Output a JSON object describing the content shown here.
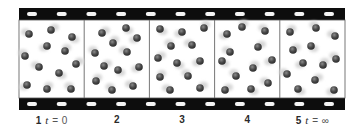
{
  "figure": {
    "colors": {
      "film": "#0d0d0d",
      "sprocket": "#f4f4f4",
      "frame_bg": "#ffffff",
      "frame_divider": "#666666",
      "molecule": "#4a4a4a",
      "molecule_highlight": "#8a8a8a",
      "motion_blur": "#d6d6d6"
    },
    "frames": [
      {
        "number": "1",
        "time_var": "t",
        "equals": "=",
        "time_value": "0",
        "molecules": [
          [
            29,
            34
          ],
          [
            51,
            30
          ],
          [
            72,
            37
          ],
          [
            47,
            46
          ],
          [
            65,
            51
          ],
          [
            25,
            56
          ],
          [
            39,
            67
          ],
          [
            76,
            64
          ],
          [
            59,
            73
          ],
          [
            27,
            85
          ],
          [
            47,
            89
          ],
          [
            71,
            89
          ]
        ]
      },
      {
        "number": "2",
        "time_var": "",
        "equals": "",
        "time_value": "",
        "molecules": [
          [
            102,
            33
          ],
          [
            126,
            28
          ],
          [
            137,
            38
          ],
          [
            113,
            43
          ],
          [
            95,
            53
          ],
          [
            127,
            52
          ],
          [
            104,
            66
          ],
          [
            118,
            70
          ],
          [
            139,
            67
          ],
          [
            96,
            81
          ],
          [
            112,
            90
          ],
          [
            133,
            86
          ]
        ]
      },
      {
        "number": "3",
        "time_var": "",
        "equals": "",
        "time_value": "",
        "molecules": [
          [
            160,
            29
          ],
          [
            182,
            32
          ],
          [
            204,
            28
          ],
          [
            171,
            46
          ],
          [
            192,
            45
          ],
          [
            158,
            58
          ],
          [
            177,
            63
          ],
          [
            200,
            61
          ],
          [
            160,
            77
          ],
          [
            188,
            76
          ],
          [
            170,
            90
          ],
          [
            200,
            88
          ]
        ]
      },
      {
        "number": "4",
        "time_var": "",
        "equals": "",
        "time_value": "",
        "molecules": [
          [
            227,
            34
          ],
          [
            242,
            27
          ],
          [
            265,
            31
          ],
          [
            230,
            52
          ],
          [
            258,
            47
          ],
          [
            222,
            61
          ],
          [
            272,
            60
          ],
          [
            253,
            68
          ],
          [
            236,
            76
          ],
          [
            268,
            83
          ],
          [
            225,
            90
          ],
          [
            251,
            89
          ]
        ]
      },
      {
        "number": "5",
        "time_var": "t",
        "equals": "=",
        "time_value": "∞",
        "molecules": [
          [
            290,
            32
          ],
          [
            316,
            28
          ],
          [
            335,
            36
          ],
          [
            293,
            50
          ],
          [
            311,
            46
          ],
          [
            303,
            63
          ],
          [
            323,
            65
          ],
          [
            336,
            59
          ],
          [
            287,
            74
          ],
          [
            315,
            80
          ],
          [
            298,
            89
          ],
          [
            334,
            90
          ]
        ]
      }
    ]
  }
}
